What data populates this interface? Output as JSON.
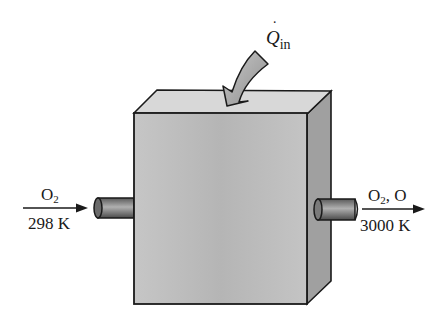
{
  "diagram": {
    "type": "control-volume-reactor",
    "heat_input": {
      "symbol": "Q",
      "subscript": "in",
      "dotted": true
    },
    "inlet": {
      "species_main": "O",
      "species_sub": "2",
      "temperature": "298 K"
    },
    "outlet": {
      "species_main": "O",
      "species_sub": "2",
      "species_extra": ", O",
      "temperature": "3000 K"
    },
    "colors": {
      "front_face": "#b9b9b9",
      "top_face": "#d6d6d6",
      "side_face": "#9a9a9a",
      "pipe": "#8c8c8c",
      "arrow_fill": "#a8a8a8",
      "stroke": "#1a1a1a"
    }
  }
}
